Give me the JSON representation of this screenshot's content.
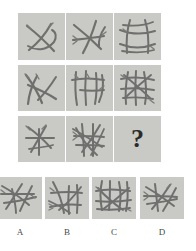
{
  "puzzle": {
    "type": "matrix-reasoning",
    "title": "Stick figure progressive matrix",
    "missing_cell_marker": "?",
    "tile_color": "#c9c9c5",
    "stick_color": "#6f6f6e",
    "page_background": "#ffffff"
  },
  "matrix": {
    "rows": 3,
    "columns": 3,
    "cells": [
      {
        "id": "r1c1",
        "row": 1,
        "col": 1,
        "stick_count": 3,
        "x": 18,
        "y": 13,
        "w": 47,
        "h": 47
      },
      {
        "id": "r1c2",
        "row": 1,
        "col": 2,
        "stick_count": 4,
        "x": 66,
        "y": 13,
        "w": 47,
        "h": 47
      },
      {
        "id": "r1c3",
        "row": 1,
        "col": 3,
        "stick_count": 6,
        "x": 114,
        "y": 13,
        "w": 47,
        "h": 47
      },
      {
        "id": "r2c1",
        "row": 2,
        "col": 1,
        "stick_count": 4,
        "x": 18,
        "y": 65,
        "w": 47,
        "h": 46
      },
      {
        "id": "r2c2",
        "row": 2,
        "col": 2,
        "stick_count": 6,
        "x": 66,
        "y": 65,
        "w": 47,
        "h": 46
      },
      {
        "id": "r2c3",
        "row": 2,
        "col": 3,
        "stick_count": 8,
        "x": 114,
        "y": 65,
        "w": 47,
        "h": 46
      },
      {
        "id": "r3c1",
        "row": 3,
        "col": 1,
        "stick_count": 5,
        "x": 18,
        "y": 116,
        "w": 47,
        "h": 46
      },
      {
        "id": "r3c2",
        "row": 3,
        "col": 2,
        "stick_count": 8,
        "x": 66,
        "y": 116,
        "w": 47,
        "h": 46
      },
      {
        "id": "r3c3",
        "row": 3,
        "col": 3,
        "stick_count": 0,
        "x": 114,
        "y": 116,
        "w": 47,
        "h": 46,
        "is_missing": true
      }
    ]
  },
  "options": {
    "count": 4,
    "items": [
      {
        "id": "option-a",
        "label": "A",
        "stick_count": 6,
        "x": -2,
        "y": 177,
        "w": 44,
        "h": 42,
        "label_x": 0,
        "label_y": 228,
        "label_w": 40
      },
      {
        "id": "option-b",
        "label": "B",
        "stick_count": 7,
        "x": 45,
        "y": 177,
        "w": 44,
        "h": 42,
        "label_x": 45,
        "label_y": 228,
        "label_w": 44
      },
      {
        "id": "option-c",
        "label": "C",
        "stick_count": 9,
        "x": 92,
        "y": 177,
        "w": 44,
        "h": 42,
        "label_x": 92,
        "label_y": 228,
        "label_w": 44
      },
      {
        "id": "option-d",
        "label": "D",
        "stick_count": 6,
        "x": 140,
        "y": 177,
        "w": 44,
        "h": 42,
        "label_x": 140,
        "label_y": 228,
        "label_w": 44
      }
    ]
  }
}
